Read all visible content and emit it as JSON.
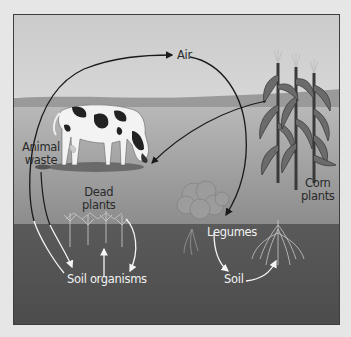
{
  "diagram": {
    "type": "nitrogen-cycle-illustration",
    "labels": {
      "air": "Air",
      "animal_waste": "Animal\nwaste",
      "animal_waste_line1": "Animal",
      "animal_waste_line2": "waste",
      "dead_plants_line1": "Dead",
      "dead_plants_line2": "plants",
      "corn_plants_line1": "Corn",
      "corn_plants_line2": "plants",
      "legumes": "Legumes",
      "soil_organisms": "Soil organisms",
      "soil": "Soil"
    },
    "flows": [
      {
        "from": "Soil organisms",
        "to": "Air"
      },
      {
        "from": "Air",
        "to": "Legumes"
      },
      {
        "from": "Corn plants",
        "to": "Cow"
      },
      {
        "from": "Animal waste",
        "to": "Soil organisms"
      },
      {
        "from": "Dead plants",
        "to": "Soil organisms"
      },
      {
        "from": "Legumes",
        "to": "Soil"
      },
      {
        "from": "Soil",
        "to": "Corn plants"
      }
    ],
    "colors": {
      "sky": "#c9c9c9",
      "hills": "#9a9a9a",
      "field": "#b0b0b0",
      "soil": "#555555",
      "frame_border": "#3e3e3e",
      "page_bg": "#e6e6e6"
    }
  }
}
